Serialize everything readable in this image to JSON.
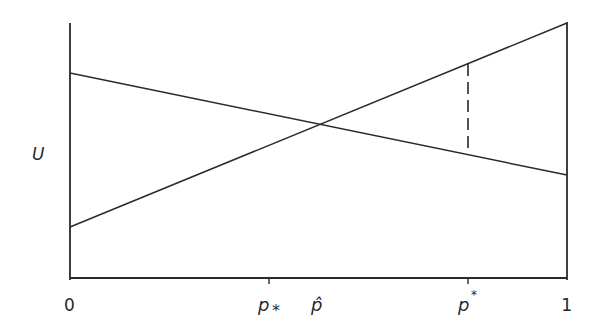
{
  "diagram": {
    "y_axis_label": "U",
    "x_ticks": {
      "zero": "0",
      "p_lower": "p",
      "p_lower_sub": "*",
      "p_hat": "p̂",
      "p_star": "p",
      "p_star_sup": "*",
      "one": "1"
    },
    "lines": [
      {
        "name": "decreasing-utility-line",
        "from": [
          0,
          0.8
        ],
        "to": [
          1,
          0.4
        ]
      },
      {
        "name": "increasing-utility-line",
        "from": [
          0,
          0.2
        ],
        "to": [
          1,
          1.0
        ]
      }
    ],
    "intersection_x": "p̂",
    "dashed_segment_at": "p*",
    "colors": {
      "ink": "#2a2a2a",
      "background": "#ffffff"
    }
  }
}
